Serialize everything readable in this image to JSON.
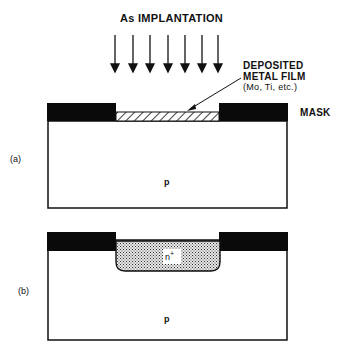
{
  "title": "As IMPLANTATION",
  "film_label": {
    "line1": "DEPOSITED",
    "line2": "METAL FILM",
    "line3": "(Mo, Ti, etc.)"
  },
  "mask_label": "MASK",
  "panel_a": {
    "label": "(a)",
    "substrate": "p"
  },
  "panel_b": {
    "label": "(b)",
    "substrate": "p",
    "implant": "n",
    "implant_sup": "+"
  },
  "arrows": {
    "count": 7
  }
}
